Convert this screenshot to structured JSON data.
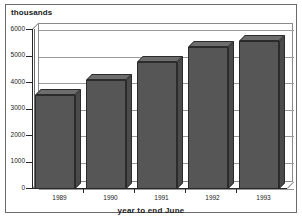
{
  "chart_data": {
    "type": "bar",
    "title": "",
    "subtitle": "",
    "categories": [
      "1989",
      "1990",
      "1991",
      "1992",
      "1993"
    ],
    "values": [
      3550,
      4100,
      4800,
      5350,
      5570
    ],
    "series": [
      {
        "name": "thousands",
        "values": [
          3550,
          4100,
          4800,
          5350,
          5570
        ]
      }
    ],
    "xlabel": "year to end June",
    "ylabel": "thousands",
    "ylim": [
      0,
      6000
    ],
    "yticks": [
      0,
      1000,
      2000,
      3000,
      4000,
      5000,
      6000
    ],
    "ytick_labels": [
      "0",
      "1000",
      "2000",
      "3000",
      "4000",
      "5000",
      "6000"
    ],
    "grid": true,
    "legend": false,
    "legend_position": "none",
    "style": "3d-column",
    "bar_color": "#565656",
    "bar_top_color": "#6d6d6d",
    "bar_side_color": "#4a4a4a",
    "grid_color": "#9a9a9a",
    "axis_color": "#262626",
    "frame_color": "#6a6a6a",
    "background": "#ffffff"
  },
  "axis": {
    "y_unit_caption": "thousands",
    "x_axis_title": "year to end June"
  }
}
